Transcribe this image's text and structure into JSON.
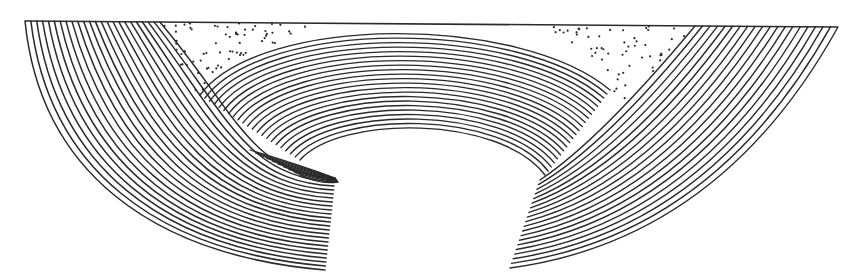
{
  "figure": {
    "type": "geological-cross-section",
    "colors": {
      "ink": "#2a2a2a",
      "paper": "#ffffff"
    },
    "layers": {
      "left_flank_lines": 24,
      "arch_lines": 22,
      "right_flank_lines": 20
    },
    "regions": [
      {
        "name": "left-dipping-strata"
      },
      {
        "name": "central-arch-strata"
      },
      {
        "name": "right-dipping-strata"
      },
      {
        "name": "left-dotted-infill"
      },
      {
        "name": "right-dotted-infill"
      },
      {
        "name": "eroded-core-gap"
      }
    ]
  }
}
